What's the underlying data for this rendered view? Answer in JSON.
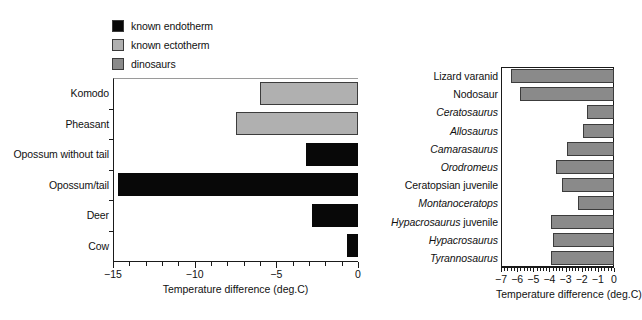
{
  "legend": {
    "items": [
      {
        "label": "known endotherm",
        "color": "#080808"
      },
      {
        "label": "known ectotherm",
        "color": "#b0b0b0"
      },
      {
        "label": "dinosaurs",
        "color": "#8a8a8a"
      }
    ]
  },
  "chart_data": [
    {
      "id": "left",
      "type": "bar",
      "orientation": "horizontal",
      "title": "",
      "xlabel": "Temperature difference (deg.C)",
      "ylabel": "",
      "xlim": [
        -15,
        0
      ],
      "xticks": [
        -15,
        -10,
        -5,
        0
      ],
      "xtick_labels": [
        "−15",
        "−10",
        "−5",
        "0"
      ],
      "minor_tick_step": 1,
      "grid": false,
      "legend_position": "above-left",
      "categories": [
        "Komodo",
        "Pheasant",
        "Opossum without tail",
        "Opossum/tail",
        "Deer",
        "Cow"
      ],
      "values": [
        -6.0,
        -7.5,
        -3.2,
        -14.7,
        -2.8,
        -0.7
      ],
      "bar_colors": [
        "#b0b0b0",
        "#b0b0b0",
        "#080808",
        "#080808",
        "#080808",
        "#080808"
      ],
      "bar_groups": [
        "known ectotherm",
        "known ectotherm",
        "known endotherm",
        "known endotherm",
        "known endotherm",
        "known endotherm"
      ]
    },
    {
      "id": "right",
      "type": "bar",
      "orientation": "horizontal",
      "title": "",
      "xlabel": "Temperature difference (deg.C)",
      "ylabel": "",
      "xlim": [
        -7,
        0
      ],
      "xticks": [
        -7,
        -6,
        -5,
        -4,
        -3,
        -2,
        -1,
        0
      ],
      "xtick_labels": [
        "−7",
        "−6",
        "−5",
        "−4",
        "−3",
        "−2",
        "−1",
        "0"
      ],
      "minor_tick_step": 0.2,
      "grid": false,
      "categories": [
        "Lizard varanid",
        "Nodosaur",
        "Ceratosaurus",
        "Allosaurus",
        "Camarasaurus",
        "Orodromeus",
        "Ceratopsian juvenile",
        "Montanoceratops",
        "Hypacrosaurus juvenile",
        "Hypacrosaurus",
        "Tyrannosaurus"
      ],
      "category_styles": [
        "roman",
        "roman",
        "italic",
        "italic",
        "italic",
        "italic",
        "roman",
        "italic",
        "italic-partial",
        "italic",
        "italic"
      ],
      "values": [
        -6.4,
        -5.8,
        -1.7,
        -1.9,
        -2.9,
        -3.6,
        -3.2,
        -2.2,
        -3.9,
        -3.8,
        -3.9
      ],
      "bar_color": "#8a8a8a",
      "bar_group": "dinosaurs"
    }
  ]
}
